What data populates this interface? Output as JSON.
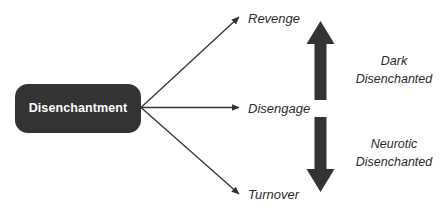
{
  "diagram": {
    "type": "fan-out-process-diagram",
    "canvas": {
      "width": 442,
      "height": 214,
      "background": "#ffffff"
    },
    "palette": {
      "shape_fill": "#333333",
      "shape_text": "#ffffff",
      "connector": "#333333",
      "label_text": "#2b2b2b"
    },
    "source": {
      "label": "Disenchantment",
      "shape": "rounded-rectangle"
    },
    "outcomes": [
      {
        "id": "revenge",
        "label": "Revenge",
        "direction": "up",
        "connector": "thin-arrow"
      },
      {
        "id": "disengage",
        "label": "Disengage",
        "direction": "horizontal",
        "connector": "thin-arrow"
      },
      {
        "id": "turnover",
        "label": "Turnover",
        "direction": "down",
        "connector": "thin-arrow"
      }
    ],
    "clusters": [
      {
        "id": "dark",
        "arrow": "up-block-arrow",
        "line1": "Dark",
        "line2": "Disenchanted"
      },
      {
        "id": "neurotic",
        "arrow": "down-block-arrow",
        "line1": "Neurotic",
        "line2": "Disenchanted"
      }
    ]
  }
}
